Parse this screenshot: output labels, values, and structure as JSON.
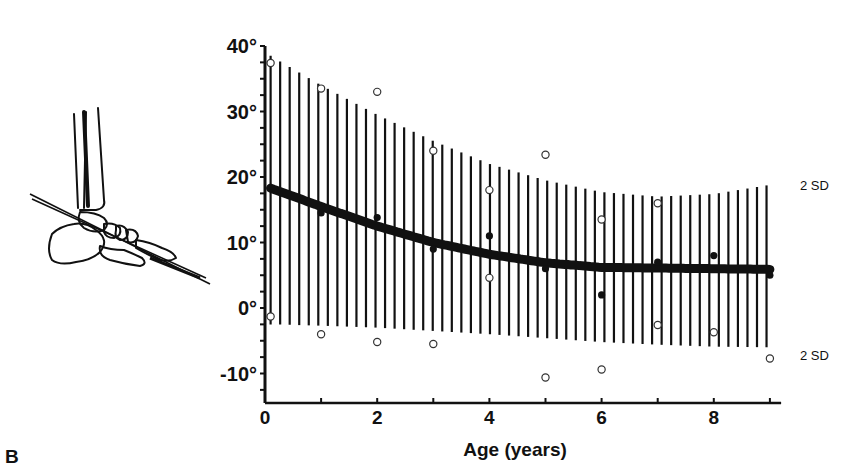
{
  "figure": {
    "panel_label": "B",
    "illustration": "lateral-ankle-foot-radiograph-angle-diagram"
  },
  "chart_data": {
    "type": "scatter",
    "title": "",
    "xlabel": "Age (years)",
    "ylabel": "",
    "xlim": [
      0,
      9.2
    ],
    "ylim": [
      -14.5,
      40
    ],
    "x_ticks": [
      0,
      1,
      2,
      3,
      4,
      5,
      6,
      7,
      8,
      9
    ],
    "x_tick_labels": [
      {
        "v": 0,
        "label": "0"
      },
      {
        "v": 2,
        "label": "2"
      },
      {
        "v": 4,
        "label": "4"
      },
      {
        "v": 6,
        "label": "6"
      },
      {
        "v": 8,
        "label": "8"
      }
    ],
    "y_ticks": [
      -12.5,
      -10,
      -7.5,
      -5,
      -2.5,
      0,
      2.5,
      5,
      7.5,
      10,
      12.5,
      15,
      17.5,
      20,
      22.5,
      25,
      27.5,
      30,
      32.5,
      35,
      37.5,
      40
    ],
    "y_tick_labels": [
      {
        "v": 40,
        "label": "40°"
      },
      {
        "v": 30,
        "label": "30°"
      },
      {
        "v": 20,
        "label": "20°"
      },
      {
        "v": 10,
        "label": "10°"
      },
      {
        "v": 0,
        "label": "0°"
      },
      {
        "v": -10,
        "label": "-10°"
      }
    ],
    "grid": false,
    "annotations": [
      {
        "text": "2 SD",
        "x": 9.2,
        "y": 18.8,
        "position": "upper-band-end"
      },
      {
        "text": "2 SD",
        "x": 9.2,
        "y": -7.2,
        "position": "lower-band-end"
      }
    ],
    "mean_curve": {
      "name": "Mean",
      "x": [
        0.1,
        1,
        2,
        3,
        4,
        5,
        6,
        7,
        8,
        9
      ],
      "y": [
        18.3,
        15.5,
        12.5,
        10.0,
        8.2,
        6.9,
        6.2,
        6.1,
        6.0,
        5.9
      ]
    },
    "sd_band": {
      "name": "±2 SD",
      "x": [
        0.1,
        1,
        2,
        3,
        4,
        5,
        6,
        7,
        8,
        9
      ],
      "upper": [
        38.5,
        34.0,
        29.5,
        25.5,
        22.0,
        19.5,
        17.7,
        17.0,
        17.4,
        18.8
      ],
      "lower": [
        -2.5,
        -2.7,
        -3.0,
        -3.5,
        -4.0,
        -4.6,
        -5.2,
        -5.6,
        -5.9,
        -6.0
      ]
    },
    "series": [
      {
        "name": "Open circles (individual values)",
        "marker": "open-circle",
        "points": [
          {
            "x": 0.1,
            "y": 37.4
          },
          {
            "x": 0.1,
            "y": -1.3
          },
          {
            "x": 1,
            "y": 33.5
          },
          {
            "x": 1,
            "y": -4.0
          },
          {
            "x": 2,
            "y": 33.0
          },
          {
            "x": 2,
            "y": -5.2
          },
          {
            "x": 3,
            "y": 24.0
          },
          {
            "x": 3,
            "y": -5.5
          },
          {
            "x": 4,
            "y": 18.0
          },
          {
            "x": 4,
            "y": 4.6
          },
          {
            "x": 5,
            "y": 23.4
          },
          {
            "x": 5,
            "y": -10.6
          },
          {
            "x": 6,
            "y": 13.5
          },
          {
            "x": 6,
            "y": -9.4
          },
          {
            "x": 7,
            "y": 16.0
          },
          {
            "x": 7,
            "y": -2.6
          },
          {
            "x": 8,
            "y": -3.7
          },
          {
            "x": 9,
            "y": -7.7
          }
        ]
      },
      {
        "name": "Filled circles (mean values)",
        "marker": "filled-circle",
        "points": [
          {
            "x": 1,
            "y": 14.5
          },
          {
            "x": 2,
            "y": 13.8
          },
          {
            "x": 3,
            "y": 9.0
          },
          {
            "x": 4,
            "y": 11.0
          },
          {
            "x": 5,
            "y": 6.0
          },
          {
            "x": 6,
            "y": 2.0
          },
          {
            "x": 7,
            "y": 7.0
          },
          {
            "x": 8,
            "y": 8.0
          },
          {
            "x": 9,
            "y": 5.0
          }
        ]
      }
    ],
    "colors": {
      "ink": "#111111",
      "background": "#ffffff"
    }
  }
}
